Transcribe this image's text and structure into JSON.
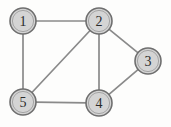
{
  "figure": {
    "background_color": "#fdfdfc"
  },
  "style": {
    "node_fill": "#d4d4d4",
    "node_stroke": "#6f6f6f",
    "node_inner_stroke": "#9e9e9e",
    "edge_color": "#8a8a8a",
    "label_color": "#2b2b2b",
    "node_radius": 13,
    "edge_width": 1.7
  },
  "chart_data": {
    "type": "diagram",
    "subtype": "node-link-graph",
    "title": "",
    "directed": false,
    "weighted": false,
    "node_count": 5,
    "edge_count": 7,
    "nodes": [
      {
        "id": "1",
        "label": "1",
        "x": 23,
        "y": 21,
        "r": 13
      },
      {
        "id": "2",
        "label": "2",
        "x": 99,
        "y": 21,
        "r": 13
      },
      {
        "id": "3",
        "label": "3",
        "x": 148,
        "y": 61,
        "r": 13
      },
      {
        "id": "4",
        "label": "4",
        "x": 99,
        "y": 103,
        "r": 13
      },
      {
        "id": "5",
        "label": "5",
        "x": 23,
        "y": 102,
        "r": 13
      }
    ],
    "edges": [
      {
        "source": "1",
        "target": "2",
        "name": "edge-1-2"
      },
      {
        "source": "1",
        "target": "5",
        "name": "edge-1-5"
      },
      {
        "source": "2",
        "target": "5",
        "name": "edge-2-5"
      },
      {
        "source": "2",
        "target": "4",
        "name": "edge-2-4"
      },
      {
        "source": "2",
        "target": "3",
        "name": "edge-2-3"
      },
      {
        "source": "3",
        "target": "4",
        "name": "edge-3-4"
      },
      {
        "source": "4",
        "target": "5",
        "name": "edge-4-5"
      }
    ],
    "adjacency": {
      "1": [
        "2",
        "5"
      ],
      "2": [
        "1",
        "5",
        "4",
        "3"
      ],
      "3": [
        "2",
        "4"
      ],
      "4": [
        "2",
        "3",
        "5"
      ],
      "5": [
        "1",
        "2",
        "4"
      ]
    },
    "degrees": {
      "1": 2,
      "2": 4,
      "3": 2,
      "4": 3,
      "5": 3
    }
  }
}
